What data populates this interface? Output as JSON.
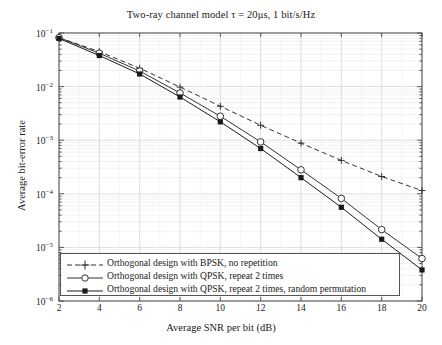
{
  "chart_data": {
    "type": "line",
    "title": "Two-ray channel model τ = 20μs, 1 bit/s/Hz",
    "xlabel": "Average SNR per bit (dB)",
    "ylabel": "Average bit-error rate",
    "xlim": [
      2,
      20
    ],
    "ylim": [
      1e-06,
      0.1
    ],
    "yscale": "log",
    "grid": true,
    "legend_position": "lower-left",
    "xticks": [
      2,
      4,
      6,
      8,
      10,
      12,
      14,
      16,
      18,
      20
    ],
    "xtick_labels": [
      "2",
      "4",
      "6",
      "8",
      "10",
      "12",
      "14",
      "16",
      "18",
      "20"
    ],
    "yticks": [
      0.1,
      0.01,
      0.001,
      0.0001,
      1e-05,
      1e-06
    ],
    "ytick_labels": [
      "10−1",
      "10−2",
      "10−3",
      "10−4",
      "10−5",
      "10−6"
    ],
    "ytick_mantissa": "10",
    "ytick_exponents": [
      "-1",
      "-2",
      "-3",
      "-4",
      "-5",
      "-6"
    ],
    "x": [
      2,
      4,
      6,
      8,
      10,
      12,
      14,
      16,
      18,
      20
    ],
    "series": [
      {
        "name": "Orthogonal design with BPSK, no repetition",
        "marker": "plus",
        "linestyle": "dashed",
        "color": "#333333",
        "values": [
          0.082,
          0.045,
          0.022,
          0.0098,
          0.0043,
          0.0019,
          0.00088,
          0.00042,
          0.00021,
          0.000115
        ]
      },
      {
        "name": "Orthogonal design with QPSK, repeat 2 times",
        "marker": "circle-open",
        "linestyle": "solid",
        "color": "#333333",
        "values": [
          0.082,
          0.042,
          0.0195,
          0.0076,
          0.0028,
          0.00093,
          0.00028,
          8.2e-05,
          2.15e-05,
          6.2e-06
        ]
      },
      {
        "name": "Orthogonal design with QPSK, repeat 2 times, random permutation",
        "marker": "square-filled",
        "linestyle": "solid",
        "color": "#1a1a1a",
        "values": [
          0.079,
          0.038,
          0.0172,
          0.0064,
          0.0022,
          0.0007,
          0.0002,
          5.6e-05,
          1.42e-05,
          3.8e-06
        ]
      }
    ]
  },
  "axes": {
    "title": "Two-ray channel model τ = 20μs, 1 bit/s/Hz",
    "xlabel": "Average SNR per bit (dB)",
    "ylabel": "Average bit-error rate"
  },
  "legend": {
    "items": [
      {
        "label": "Orthogonal design with BPSK, no repetition"
      },
      {
        "label": "Orthogonal design with QPSK, repeat 2 times"
      },
      {
        "label": "Orthogonal design with QPSK, repeat 2 times, random permutation"
      }
    ]
  }
}
